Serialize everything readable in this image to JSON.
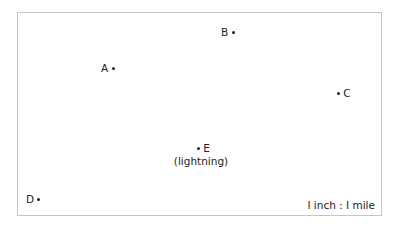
{
  "diagram": {
    "points": [
      {
        "label": "A",
        "position": "label-left"
      },
      {
        "label": "B",
        "position": "label-left"
      },
      {
        "label": "C",
        "position": "label-right"
      },
      {
        "label": "D",
        "position": "label-left"
      },
      {
        "label": "E",
        "position": "label-right",
        "caption": "(lightning)"
      }
    ],
    "scale": "I inch : I mile"
  }
}
